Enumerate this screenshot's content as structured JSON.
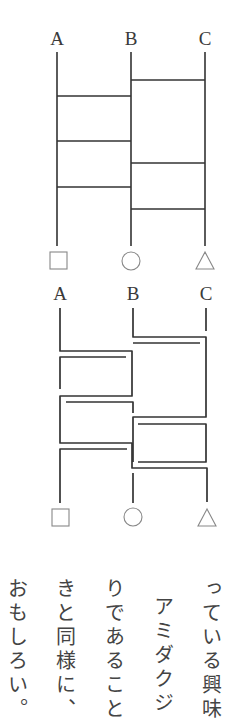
{
  "ladder1": {
    "top_labels": [
      "A",
      "B",
      "C"
    ],
    "bottom_symbols": [
      "square",
      "circle",
      "triangle"
    ],
    "columns_x": [
      57,
      131,
      205
    ],
    "line_top_y": 52,
    "line_bottom_y": 246,
    "rungs": [
      {
        "between": "B-C",
        "y": 80
      },
      {
        "between": "A-B",
        "y": 96
      },
      {
        "between": "A-B",
        "y": 141
      },
      {
        "between": "B-C",
        "y": 163
      },
      {
        "between": "A-B",
        "y": 187
      },
      {
        "between": "B-C",
        "y": 209
      }
    ]
  },
  "ladder2": {
    "top_labels": [
      "A",
      "B",
      "C"
    ],
    "bottom_symbols": [
      "square",
      "circle",
      "triangle"
    ],
    "description": "Traced path version of the same ladder showing routes as parallel offset lines"
  },
  "text": {
    "direction": "vertical-rl",
    "columns": [
      "っている興味",
      "アミダクジ",
      "りであること",
      "きと同様に、",
      "おもしろい。"
    ]
  },
  "colors": {
    "line": "#333333",
    "symbol": "#777777",
    "text": "#444444",
    "background": "#ffffff"
  }
}
